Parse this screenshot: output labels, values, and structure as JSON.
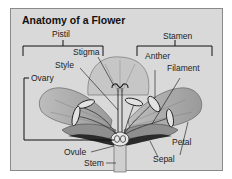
{
  "diagram": {
    "title": "Anatomy of a Flower",
    "groups": {
      "pistil": "Pistil",
      "stamen": "Stamen"
    },
    "labels": {
      "stigma": "Stigma",
      "style": "Style",
      "ovary": "Ovary",
      "anther": "Anther",
      "filament": "Filament",
      "petal": "Petal",
      "ovule": "Ovule",
      "stem": "Stem",
      "sepal": "Sepal"
    },
    "colors": {
      "panel_bg": "#d9d9d9",
      "line": "#222222",
      "petal_fill": "#a8a8a8"
    }
  }
}
